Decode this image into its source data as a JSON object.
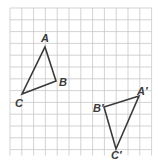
{
  "figure": {
    "grid": {
      "x0": 10,
      "y0": 8,
      "cols": 12,
      "rows": 12.5,
      "cell": 11.8,
      "color": "#c8c8c8"
    },
    "line_color": "#3a3a3a",
    "triangles": [
      {
        "name": "ABC",
        "points": {
          "A": [
            45,
            47
          ],
          "B": [
            56,
            81
          ],
          "C": [
            22,
            94
          ]
        },
        "labels": {
          "A": "A",
          "B": "B",
          "C": "C"
        }
      },
      {
        "name": "A'B'C'",
        "points": {
          "A'": [
            139,
            96
          ],
          "B'": [
            104,
            107
          ],
          "C'": [
            116,
            149
          ]
        },
        "labels": {
          "A'": "A′",
          "B'": "B′",
          "C'": "C′"
        }
      }
    ]
  }
}
